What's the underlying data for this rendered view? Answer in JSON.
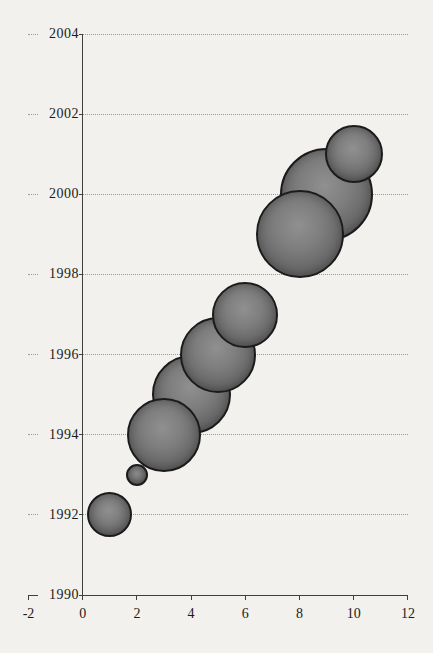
{
  "chart_data": {
    "type": "scatter",
    "subtype": "bubble",
    "title": "",
    "xlabel": "",
    "ylabel": "",
    "xlim": [
      -2,
      12
    ],
    "ylim": [
      1990,
      2004
    ],
    "x_ticks": [
      -2,
      0,
      2,
      4,
      6,
      8,
      10,
      12
    ],
    "y_ticks": [
      1990,
      1992,
      1994,
      1996,
      1998,
      2000,
      2002,
      2004
    ],
    "grid": "horizontal-dotted",
    "legend": "none",
    "points": [
      {
        "x": 1,
        "y": 1992,
        "radius_px": 22.5,
        "z": 9
      },
      {
        "x": 2,
        "y": 1993,
        "radius_px": 11,
        "z": 8
      },
      {
        "x": 3,
        "y": 1994,
        "radius_px": 37,
        "z": 7
      },
      {
        "x": 4,
        "y": 1995,
        "radius_px": 39.5,
        "z": 4
      },
      {
        "x": 5,
        "y": 1996,
        "radius_px": 38,
        "z": 5
      },
      {
        "x": 6,
        "y": 1997,
        "radius_px": 33,
        "z": 6
      },
      {
        "x": 8,
        "y": 1999,
        "radius_px": 44,
        "z": 2
      },
      {
        "x": 9,
        "y": 2000,
        "radius_px": 46.5,
        "z": 1
      },
      {
        "x": 10,
        "y": 2001,
        "radius_px": 29,
        "z": 3
      }
    ],
    "colors": {
      "background": "#f2f1ed",
      "bubble_fill_center": "#909090",
      "bubble_fill_edge": "#454545",
      "bubble_outline": "#1b1b1b",
      "axis": "#3f3f3d",
      "gridline": "#9b9b98",
      "text": "#1c1b19"
    }
  }
}
